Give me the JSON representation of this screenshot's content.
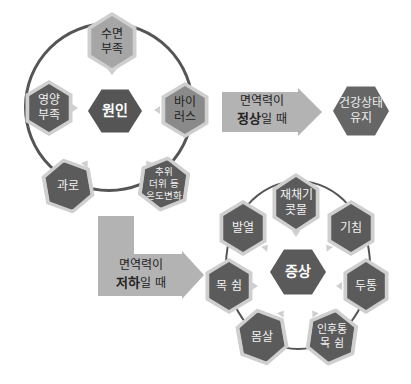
{
  "causes": {
    "center": "원인",
    "items": [
      {
        "id": "sleep",
        "label_line1": "수면",
        "label_line2": "부족"
      },
      {
        "id": "virus",
        "label_line1": "바이",
        "label_line2": "러스"
      },
      {
        "id": "temperature",
        "label_line1": "추위",
        "label_line2": "더위 등",
        "label_line3": "온도변화"
      },
      {
        "id": "fatigue",
        "label_line1": "과로"
      },
      {
        "id": "nutrition",
        "label_line1": "영양",
        "label_line2": "부족"
      }
    ]
  },
  "normal_path": {
    "arrow_line1": "면역력이",
    "arrow_bold": "정상",
    "arrow_rest": "일 때",
    "result_line1": "건강상태",
    "result_line2": "유지"
  },
  "low_path": {
    "arrow_line1": "면역력이",
    "arrow_bold": "저하",
    "arrow_rest": "일 때"
  },
  "symptoms": {
    "center": "증상",
    "items": [
      {
        "id": "sneeze",
        "label_line1": "재채기",
        "label_line2": "콧물"
      },
      {
        "id": "cough",
        "label_line1": "기침"
      },
      {
        "id": "headache",
        "label_line1": "두통"
      },
      {
        "id": "sore-throat",
        "label_line1": "인후통",
        "label_line2": "목 쉼"
      },
      {
        "id": "body-ache",
        "label_line1": "몸살"
      },
      {
        "id": "hoarse",
        "label_line1": "목 쉼"
      },
      {
        "id": "fever",
        "label_line1": "발열"
      }
    ]
  },
  "colors": {
    "dark": "#5b5b5b",
    "mid": "#8a8a8a",
    "light": "#a6a6a6",
    "halo": "#cfcfcf",
    "arrow": "#b3b3b3",
    "ring": "#555555"
  }
}
